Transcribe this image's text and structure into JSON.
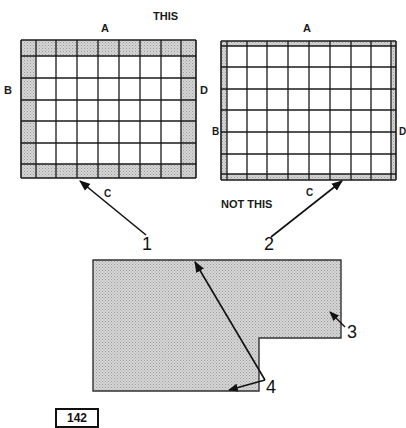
{
  "figure": {
    "caption_this": "THIS",
    "caption_not_this": "NOT THIS",
    "plate_number": "142",
    "colors": {
      "ink": "#1a1a1a",
      "shade": "#c8c8c8",
      "paper": "#ffffff"
    }
  },
  "grid_correct": {
    "label_top": "A",
    "label_left": "B",
    "label_right": "D",
    "label_bottom": "C",
    "columns": 9,
    "rows": 7,
    "border_style": "wide shaded border cells",
    "callout": "1"
  },
  "grid_incorrect": {
    "label_top": "A",
    "label_left": "B",
    "label_right": "D",
    "label_bottom": "C",
    "columns": 10,
    "rows": 8,
    "border_style": "thin shaded border strips",
    "callout": "2"
  },
  "shape": {
    "description": "L-shaped shaded area with diagonal reference line",
    "callouts": [
      "3",
      "4"
    ]
  }
}
